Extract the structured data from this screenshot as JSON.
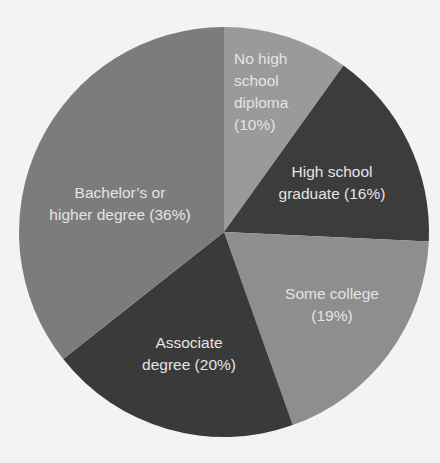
{
  "chart_data": {
    "type": "pie",
    "title": "",
    "start_angle_deg": 0,
    "direction": "clockwise",
    "slices": [
      {
        "label": "No high school diploma",
        "value": 10,
        "display": "No high\nschool\ndiploma\n(10%)",
        "color": "#9a9a9a"
      },
      {
        "label": "High school graduate",
        "value": 16,
        "display": "High school\ngraduate (16%)",
        "color": "#3c3c3c"
      },
      {
        "label": "Some college",
        "value": 19,
        "display": "Some college\n(19%)",
        "color": "#8e8e8e"
      },
      {
        "label": "Associate degree",
        "value": 20,
        "display": "Associate\ndegree (20%)",
        "color": "#3a3a3a"
      },
      {
        "label": "Bachelor's or higher degree",
        "value": 36,
        "display": "Bachelor’s or\nhigher degree (36%)",
        "color": "#7c7c7c"
      }
    ],
    "unit": "%",
    "legend": "none (inline labels)"
  }
}
